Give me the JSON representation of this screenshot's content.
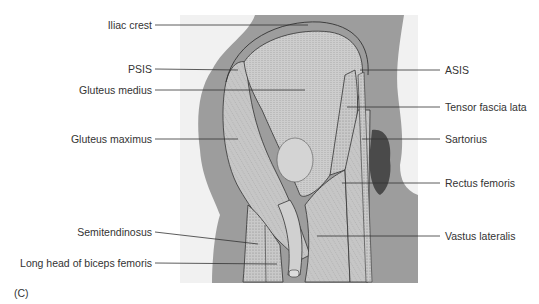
{
  "figure": {
    "panel_label": "(C)",
    "labels_left": [
      {
        "id": "iliac-crest",
        "text": "Iliac crest",
        "x": 152,
        "y": 25,
        "tx": 308,
        "ty": 25
      },
      {
        "id": "psis",
        "text": "PSIS",
        "x": 152,
        "y": 69,
        "tx": 238,
        "ty": 70
      },
      {
        "id": "gluteus-medius",
        "text": "Gluteus medius",
        "x": 152,
        "y": 90,
        "tx": 305,
        "ty": 90
      },
      {
        "id": "gluteus-maximus",
        "text": "Gluteus maximus",
        "x": 152,
        "y": 139,
        "tx": 238,
        "ty": 139
      },
      {
        "id": "semitendinosus",
        "text": "Semitendinosus",
        "x": 152,
        "y": 232,
        "tx": 258,
        "ty": 244
      },
      {
        "id": "long-head-biceps-femoris",
        "text": "Long head of biceps femoris",
        "x": 152,
        "y": 263,
        "tx": 277,
        "ty": 264
      }
    ],
    "labels_right": [
      {
        "id": "asis",
        "text": "ASIS",
        "x": 443,
        "y": 70,
        "tx": 360,
        "ty": 70
      },
      {
        "id": "tensor-fascia-lata",
        "text": "Tensor fascia lata",
        "x": 443,
        "y": 107,
        "tx": 347,
        "ty": 107
      },
      {
        "id": "sartorius",
        "text": "Sartorius",
        "x": 443,
        "y": 139,
        "tx": 362,
        "ty": 139
      },
      {
        "id": "rectus-femoris",
        "text": "Rectus femoris",
        "x": 443,
        "y": 183,
        "tx": 342,
        "ty": 183
      },
      {
        "id": "vastus-lateralis",
        "text": "Vastus lateralis",
        "x": 443,
        "y": 236,
        "tx": 317,
        "ty": 236
      }
    ]
  }
}
